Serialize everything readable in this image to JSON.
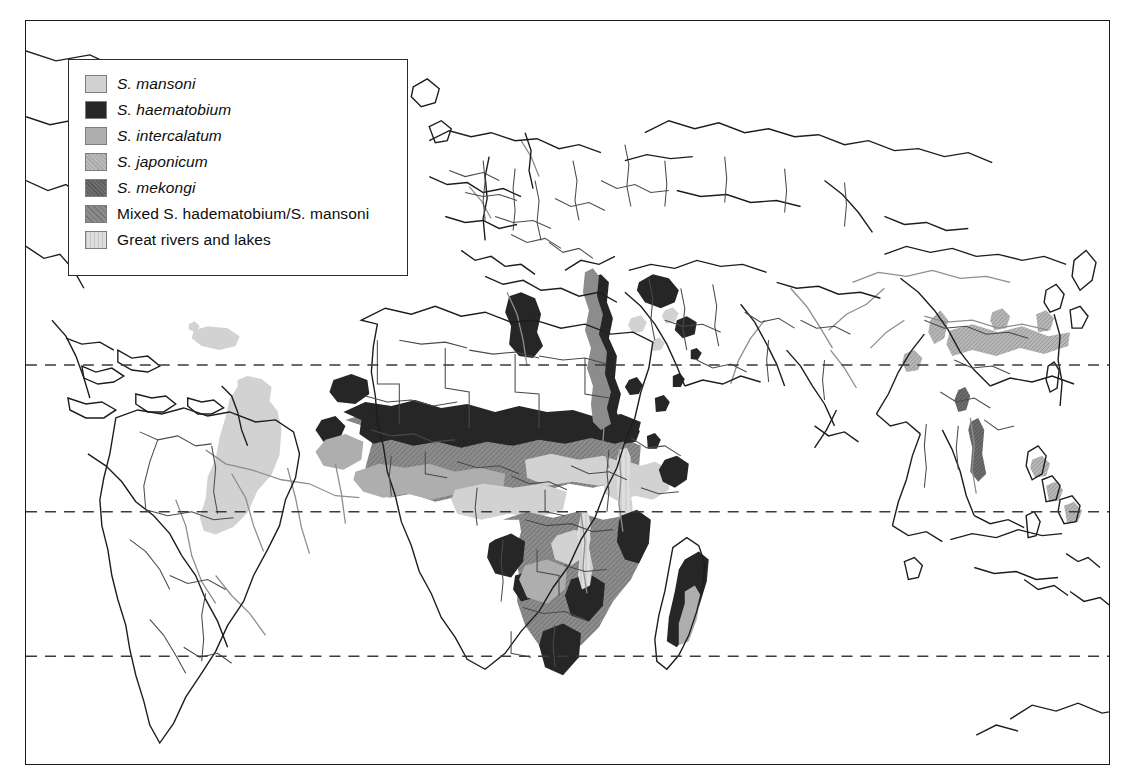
{
  "figure": {
    "kind": "world-distribution-map",
    "topic": "Global distribution of human schistosomiasis species",
    "background_color": "#ffffff",
    "frame_color": "#1a1a1a"
  },
  "legend": {
    "title": "",
    "border_color": "#2b2b2b",
    "background": "#ffffff",
    "items": [
      {
        "label": "S. mansoni",
        "italic_prefix": "S. mansoni",
        "plain_suffix": "",
        "color": "#d2d2d2",
        "swatch_name": "swatch-s-mansoni",
        "pattern": "solid"
      },
      {
        "label": "S. haematobium",
        "italic_prefix": "S. haematobium",
        "plain_suffix": "",
        "color": "#262626",
        "swatch_name": "swatch-s-haematobium",
        "pattern": "solid"
      },
      {
        "label": "S. intercalatum",
        "italic_prefix": "S. intercalatum",
        "plain_suffix": "",
        "color": "#aeaeae",
        "swatch_name": "swatch-s-intercalatum",
        "pattern": "solid"
      },
      {
        "label": "S. japonicum",
        "italic_prefix": "S. japonicum",
        "plain_suffix": "",
        "color": "#b9b9b9",
        "swatch_name": "swatch-s-japonicum",
        "pattern": "hatch"
      },
      {
        "label": "S. mekongi",
        "italic_prefix": "S. mekongi",
        "plain_suffix": "",
        "color": "#6e6e6e",
        "swatch_name": "swatch-s-mekongi",
        "pattern": "hatch"
      },
      {
        "label": "Mixed S. hadematobium/S. mansoni",
        "italic_prefix": "",
        "plain_suffix": "Mixed S. hadematobium/S. mansoni",
        "color": "#8c8c8c",
        "swatch_name": "swatch-mixed",
        "pattern": "hatch"
      },
      {
        "label": "Great rivers and lakes",
        "italic_prefix": "",
        "plain_suffix": "Great rivers and lakes",
        "color": "#dcdcdc",
        "swatch_name": "swatch-rivers-lakes",
        "pattern": "vertical-stripe"
      }
    ]
  },
  "map": {
    "graticule": {
      "style": "dashed",
      "color": "#3a3a3a",
      "lines": [
        {
          "name": "tropic-of-cancer",
          "y": 365
        },
        {
          "name": "equator",
          "y": 512
        },
        {
          "name": "tropic-of-capricorn",
          "y": 657
        }
      ]
    },
    "colors": {
      "coastline": "#1d1d1d",
      "country_border": "#4a4a4a",
      "river": "#8e8e8e",
      "s_mansoni": "#d2d2d2",
      "s_haematobium": "#262626",
      "s_intercalatum": "#aeaeae",
      "s_japonicum": "#b9b9b9",
      "s_mekongi": "#6e6e6e",
      "mixed": "#8c8c8c",
      "rivers_lakes": "#dcdcdc"
    },
    "regions": [
      {
        "name": "south-america-brazil",
        "species": "S. mansoni"
      },
      {
        "name": "west-africa-belt",
        "species": "Mixed S. hadematobium/S. mansoni"
      },
      {
        "name": "nile-valley",
        "species": "S. haematobium"
      },
      {
        "name": "east-africa-lakes",
        "species": "S. mansoni"
      },
      {
        "name": "southern-africa",
        "species": "Mixed S. hadematobium/S. mansoni"
      },
      {
        "name": "madagascar",
        "species": "Mixed S. hadematobium/S. mansoni"
      },
      {
        "name": "arabian-peninsula",
        "species": "S. haematobium"
      },
      {
        "name": "yangtze-china",
        "species": "S. japonicum"
      },
      {
        "name": "philippines",
        "species": "S. japonicum"
      },
      {
        "name": "mekong-basin",
        "species": "S. mekongi"
      }
    ]
  }
}
